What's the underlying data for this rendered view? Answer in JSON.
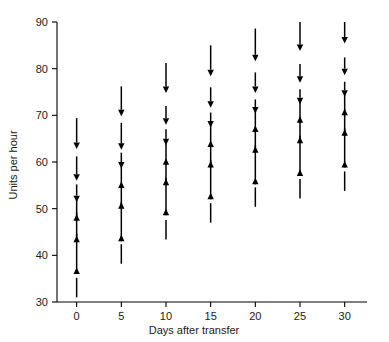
{
  "chart_data": {
    "type": "scatter",
    "title": "",
    "subtitle": "",
    "xlabel": "Days after transfer",
    "ylabel": "Units per hour",
    "xlim": [
      -2.2,
      32.5
    ],
    "ylim": [
      30,
      90
    ],
    "xticks": [
      0,
      5,
      10,
      15,
      20,
      25,
      30
    ],
    "xtick_labels": [
      "0",
      "5",
      "10",
      "15",
      "20",
      "25",
      "30"
    ],
    "yticks": [
      30,
      40,
      50,
      60,
      70,
      80,
      90
    ],
    "ytick_labels": [
      "30",
      "40",
      "50",
      "60",
      "70",
      "80",
      "90"
    ],
    "grid": false,
    "legend": false,
    "legend_position": "none",
    "marker_style": "vertical-arrow",
    "note": "Each x position shows six arrows; down arrows mark upper-bound estimates, up arrows mark lower-bound estimates. Shaft spans the range, head marks the estimate value.",
    "x": [
      0,
      5,
      10,
      15,
      20,
      25,
      30
    ],
    "series": [
      {
        "name": "arrow-1",
        "direction": "down",
        "head_values": [
          62.8,
          69.8,
          74.8,
          78.4,
          81.6,
          83.8,
          85.4
        ],
        "tail_values": [
          69.4,
          76.2,
          81.2,
          85.0,
          88.6,
          90.0,
          90.0
        ]
      },
      {
        "name": "arrow-2",
        "direction": "down",
        "head_values": [
          56.0,
          62.6,
          68.0,
          71.6,
          74.8,
          77.0,
          78.6
        ],
        "tail_values": [
          61.2,
          68.4,
          72.0,
          76.0,
          79.2,
          81.0,
          82.4
        ]
      },
      {
        "name": "arrow-3",
        "direction": "down",
        "head_values": [
          51.4,
          58.6,
          63.6,
          67.4,
          70.4,
          72.4,
          74.0
        ],
        "tail_values": [
          55.2,
          62.0,
          67.0,
          70.6,
          73.4,
          75.6,
          77.2
        ]
      },
      {
        "name": "arrow-4",
        "direction": "up",
        "head_values": [
          48.8,
          55.8,
          60.8,
          64.6,
          67.8,
          69.8,
          71.4
        ],
        "tail_values": [
          52.0,
          59.0,
          64.0,
          68.0,
          71.0,
          73.2,
          74.8
        ]
      },
      {
        "name": "arrow-5",
        "direction": "up",
        "head_values": [
          44.2,
          51.4,
          56.4,
          60.2,
          63.4,
          65.4,
          67.0
        ],
        "tail_values": [
          49.2,
          55.2,
          60.2,
          64.2,
          67.4,
          69.6,
          71.2
        ]
      },
      {
        "name": "arrow-6",
        "direction": "up",
        "head_values": [
          37.4,
          44.4,
          50.0,
          53.4,
          56.6,
          58.4,
          60.2
        ],
        "tail_values": [
          44.6,
          51.4,
          56.6,
          60.4,
          63.6,
          65.6,
          67.2
        ]
      },
      {
        "name": "arrow-7",
        "direction": "up",
        "head_values": [
          null,
          null,
          null,
          null,
          null,
          null,
          null
        ],
        "tail_values": [
          31.0,
          38.2,
          43.4,
          47.0,
          50.4,
          52.2,
          53.8
        ]
      }
    ]
  }
}
